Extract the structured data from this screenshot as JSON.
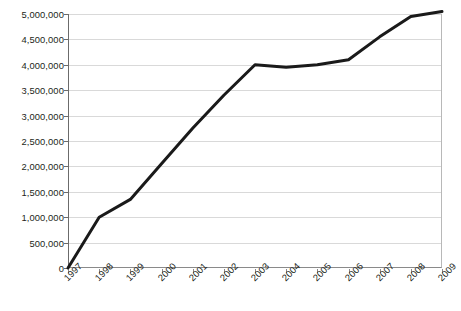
{
  "chart_data": {
    "type": "line",
    "title": "",
    "subtitle": "",
    "xlabel": "",
    "ylabel": "",
    "categories": [
      "1997",
      "1998",
      "1999",
      "2000",
      "2001",
      "2002",
      "2003",
      "2004",
      "2005",
      "2006",
      "2007",
      "2008",
      "2009"
    ],
    "x": [
      1997,
      1998,
      1999,
      2000,
      2001,
      2002,
      2003,
      2004,
      2005,
      2006,
      2007,
      2008,
      2009
    ],
    "values": [
      0,
      1000000,
      1350000,
      2050000,
      2750000,
      3400000,
      4000000,
      3950000,
      4000000,
      4100000,
      4550000,
      4950000,
      5050000
    ],
    "series": [
      {
        "name": "",
        "values": [
          0,
          1000000,
          1350000,
          2050000,
          2750000,
          3400000,
          4000000,
          3950000,
          4000000,
          4100000,
          4550000,
          4950000,
          5050000
        ],
        "color": "#1a1a1a"
      }
    ],
    "ylim": [
      0,
      5000000
    ],
    "ytick_values": [
      0,
      500000,
      1000000,
      1500000,
      2000000,
      2500000,
      3000000,
      3500000,
      4000000,
      4500000,
      5000000
    ],
    "ytick_labels": [
      "0",
      "500,000",
      "1,000,000",
      "1,500,000",
      "2,000,000",
      "2,500,000",
      "3,000,000",
      "3,500,000",
      "4,000,000",
      "4,500,000",
      "5,000,000"
    ],
    "xtick_labels": [
      "1997",
      "1998",
      "1999",
      "2000",
      "2001",
      "2002",
      "2003",
      "2004",
      "2005",
      "2006",
      "2007",
      "2008",
      "2009"
    ],
    "xtick_rotation": -45,
    "grid": {
      "horizontal": true,
      "vertical": false,
      "color": "#d9d9d9"
    },
    "legend": {
      "visible": false,
      "position": "none",
      "entries": []
    },
    "annotations": [],
    "colors": {
      "background": "#ffffff",
      "line": "#1a1a1a",
      "gridline": "#d9d9d9",
      "axis": "#6b6b6b",
      "text": "#231f20"
    },
    "line_width": 3,
    "markers": false
  }
}
